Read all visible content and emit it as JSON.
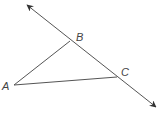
{
  "diagram": {
    "type": "geometry",
    "colors": {
      "stroke": "#444444",
      "label": "#555555",
      "background": "#ffffff"
    },
    "points": {
      "A": {
        "label": "A",
        "x": 14,
        "y": 85
      },
      "B": {
        "label": "B",
        "x": 70,
        "y": 41
      },
      "C": {
        "label": "C",
        "x": 117,
        "y": 77
      }
    },
    "line": {
      "through": [
        "B",
        "C"
      ],
      "start": {
        "x": 27,
        "y": 5
      },
      "end": {
        "x": 156,
        "y": 107
      },
      "arrows": "both"
    },
    "segments": [
      {
        "from": "A",
        "to": "B"
      },
      {
        "from": "A",
        "to": "C"
      }
    ]
  }
}
